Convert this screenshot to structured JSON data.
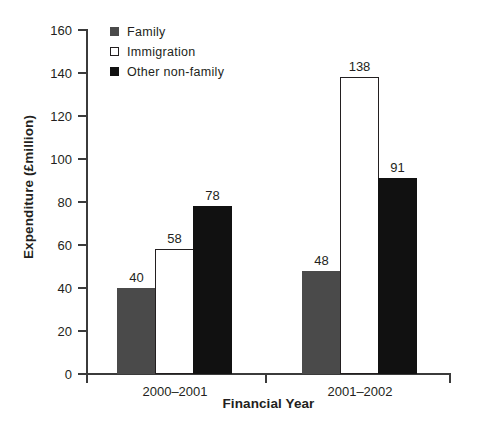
{
  "chart_data": {
    "type": "bar",
    "title": "",
    "xlabel": "Financial Year",
    "ylabel": "Expenditure (£million)",
    "categories": [
      "2000–2001",
      "2001–2002"
    ],
    "series": [
      {
        "name": "Family",
        "values": [
          40,
          58
        ]
      },
      {
        "name": "Immigration",
        "values": [
          58,
          138
        ]
      },
      {
        "name": "Other non-family",
        "values": [
          78,
          91
        ]
      }
    ],
    "series_corrected": [
      {
        "name": "Family",
        "values": [
          40,
          48
        ]
      },
      {
        "name": "Immigration",
        "values": [
          58,
          138
        ]
      },
      {
        "name": "Other non-family",
        "values": [
          78,
          91
        ]
      }
    ],
    "bars": [
      {
        "group": "2000–2001",
        "series": "Family",
        "value": 40,
        "label": "40"
      },
      {
        "group": "2000–2001",
        "series": "Immigration",
        "value": 58,
        "label": "58"
      },
      {
        "group": "2000–2001",
        "series": "Other non-family",
        "value": 78,
        "label": "78"
      },
      {
        "group": "2001–2002",
        "series": "Family",
        "value": 48,
        "label": "48"
      },
      {
        "group": "2001–2002",
        "series": "Immigration",
        "value": 138,
        "label": "138"
      },
      {
        "group": "2001–2002",
        "series": "Other non-family",
        "value": 91,
        "label": "91"
      }
    ],
    "ylim": [
      0,
      160
    ],
    "ytick_step": 20,
    "yticks": [
      0,
      20,
      40,
      60,
      80,
      100,
      120,
      140,
      160
    ],
    "ytick_labels": [
      "0",
      "20",
      "40",
      "60",
      "80",
      "100",
      "120",
      "140",
      "160"
    ],
    "grid": false,
    "legend_position": "top-left",
    "colors": {
      "family": "#4a4a4a",
      "immigration": "#ffffff",
      "immigration_border": "#231f20",
      "other_non_family": "#111111",
      "axis": "#3b3b3b",
      "text": "#231f20",
      "background": "#ffffff"
    }
  },
  "legend": {
    "items": [
      {
        "label": "Family",
        "swatch": "family-swatch"
      },
      {
        "label": "Immigration",
        "swatch": "immigration-swatch"
      },
      {
        "label": "Other non-family",
        "swatch": "other-non-family-swatch"
      }
    ]
  },
  "axes": {
    "y_title": "Expenditure (£million)",
    "x_title": "Financial Year"
  }
}
